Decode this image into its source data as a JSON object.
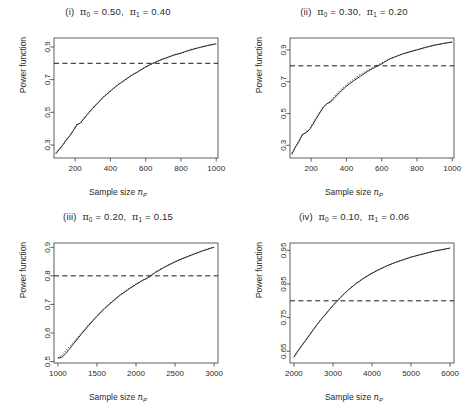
{
  "figure": {
    "background": "#ffffff",
    "line_color": "#2a2a2a",
    "reference_line_color": "#1a1a1a",
    "axis_color": "#4d4d4d",
    "n_panels": 4
  },
  "common": {
    "ylabel": "Power function",
    "xlabel_prefix": "Sample size ",
    "xlabel_symbol": "n",
    "xlabel_subscript": "P"
  },
  "chart_data": [
    {
      "type": "line",
      "panel_id": "i",
      "title": "(i)  π₀ = 0.50,  π₁ = 0.40",
      "title_parts": {
        "index": "(i)",
        "pi0_label": "π",
        "pi0_sub": "0",
        "pi0_value": "0.50",
        "pi1_label": "π",
        "pi1_sub": "1",
        "pi1_value": "0.40"
      },
      "xlabel": "Sample size n_P",
      "ylabel": "Power function",
      "xlim": [
        80,
        1010
      ],
      "ylim": [
        0.22,
        0.955
      ],
      "xticks": [
        200,
        400,
        600,
        800,
        1000
      ],
      "xticklabels": [
        "200",
        "400",
        "600",
        "800",
        "1000"
      ],
      "yticks": [
        0.3,
        0.5,
        0.7,
        0.9
      ],
      "yticklabels": [
        "0.3",
        "0.5",
        "0.7",
        "0.9"
      ],
      "grid": false,
      "legend": null,
      "reference_line": {
        "orientation": "horizontal",
        "y": 0.8,
        "style": "dashed"
      },
      "series": [
        {
          "name": "exact power",
          "style": "solid",
          "x": [
            90,
            110,
            130,
            150,
            170,
            190,
            210,
            230,
            250,
            270,
            300,
            330,
            360,
            400,
            440,
            480,
            520,
            560,
            600,
            640,
            680,
            720,
            760,
            800,
            850,
            900,
            950,
            1000
          ],
          "y": [
            0.245,
            0.272,
            0.3,
            0.33,
            0.358,
            0.388,
            0.422,
            0.436,
            0.46,
            0.489,
            0.524,
            0.56,
            0.592,
            0.631,
            0.665,
            0.697,
            0.725,
            0.752,
            0.777,
            0.8,
            0.818,
            0.835,
            0.85,
            0.863,
            0.88,
            0.896,
            0.908,
            0.92
          ]
        },
        {
          "name": "approximate power",
          "style": "dotted",
          "x": [
            90,
            110,
            130,
            150,
            170,
            190,
            210,
            230,
            250,
            270,
            300,
            330,
            360,
            400,
            440,
            480,
            520,
            560,
            600,
            640,
            680,
            720,
            760,
            800,
            850,
            900,
            950,
            1000
          ],
          "y": [
            0.252,
            0.28,
            0.296,
            0.336,
            0.352,
            0.394,
            0.43,
            0.43,
            0.468,
            0.484,
            0.53,
            0.556,
            0.597,
            0.627,
            0.67,
            0.693,
            0.73,
            0.748,
            0.781,
            0.797,
            0.822,
            0.832,
            0.854,
            0.86,
            0.884,
            0.893,
            0.911,
            0.918
          ]
        }
      ]
    },
    {
      "type": "line",
      "panel_id": "ii",
      "title": "(ii)  π₀ = 0.30,  π₁ = 0.20",
      "title_parts": {
        "index": "(ii)",
        "pi0_label": "π",
        "pi0_sub": "0",
        "pi0_value": "0.30",
        "pi1_label": "π",
        "pi1_sub": "1",
        "pi1_value": "0.20"
      },
      "xlabel": "Sample size n_P",
      "ylabel": "Power function",
      "xlim": [
        80,
        1010
      ],
      "ylim": [
        0.22,
        0.975
      ],
      "xticks": [
        200,
        400,
        600,
        800,
        1000
      ],
      "xticklabels": [
        "200",
        "400",
        "600",
        "800",
        "1000"
      ],
      "yticks": [
        0.3,
        0.5,
        0.7,
        0.9
      ],
      "yticklabels": [
        "0.3",
        "0.5",
        "0.7",
        "0.9"
      ],
      "grid": false,
      "legend": null,
      "reference_line": {
        "orientation": "horizontal",
        "y": 0.8,
        "style": "dashed"
      },
      "series": [
        {
          "name": "exact power",
          "style": "solid",
          "x": [
            90,
            110,
            130,
            150,
            170,
            190,
            210,
            230,
            250,
            270,
            290,
            310,
            330,
            360,
            400,
            440,
            480,
            520,
            560,
            600,
            640,
            680,
            720,
            760,
            800,
            850,
            900,
            950,
            1000
          ],
          "y": [
            0.242,
            0.288,
            0.322,
            0.368,
            0.378,
            0.398,
            0.432,
            0.47,
            0.505,
            0.54,
            0.562,
            0.572,
            0.596,
            0.63,
            0.672,
            0.705,
            0.735,
            0.765,
            0.79,
            0.812,
            0.84,
            0.858,
            0.875,
            0.888,
            0.9,
            0.916,
            0.93,
            0.94,
            0.95
          ]
        },
        {
          "name": "approximate power",
          "style": "dotted",
          "x": [
            90,
            110,
            130,
            150,
            170,
            190,
            210,
            230,
            250,
            270,
            290,
            310,
            330,
            360,
            400,
            440,
            480,
            520,
            560,
            600,
            640,
            680,
            720,
            760,
            800,
            850,
            900,
            950,
            1000
          ],
          "y": [
            0.25,
            0.286,
            0.33,
            0.362,
            0.386,
            0.4,
            0.44,
            0.476,
            0.512,
            0.545,
            0.56,
            0.582,
            0.606,
            0.642,
            0.682,
            0.716,
            0.746,
            0.772,
            0.796,
            0.818,
            0.842,
            0.86,
            0.876,
            0.89,
            0.902,
            0.918,
            0.93,
            0.942,
            0.95
          ]
        }
      ]
    },
    {
      "type": "line",
      "panel_id": "iii",
      "title": "(iii)  π₀ = 0.20,  π₁ = 0.15",
      "title_parts": {
        "index": "(iii)",
        "pi0_label": "π",
        "pi0_sub": "0",
        "pi0_value": "0.20",
        "pi1_label": "π",
        "pi1_sub": "1",
        "pi1_value": "0.15"
      },
      "xlabel": "Sample size n_P",
      "ylabel": "Power function",
      "xlim": [
        950,
        3050
      ],
      "ylim": [
        0.495,
        0.915
      ],
      "xticks": [
        1000,
        1500,
        2000,
        2500,
        3000
      ],
      "xticklabels": [
        "1000",
        "1500",
        "2000",
        "2500",
        "3000"
      ],
      "yticks": [
        0.5,
        0.6,
        0.7,
        0.8,
        0.9
      ],
      "yticklabels": [
        "0.5",
        "0.6",
        "0.7",
        "0.8",
        "0.9"
      ],
      "grid": false,
      "legend": null,
      "reference_line": {
        "orientation": "horizontal",
        "y": 0.8,
        "style": "dashed"
      },
      "series": [
        {
          "name": "exact power",
          "style": "solid",
          "x": [
            1000,
            1050,
            1100,
            1150,
            1200,
            1300,
            1400,
            1500,
            1600,
            1700,
            1800,
            1900,
            2000,
            2100,
            2150,
            2250,
            2350,
            2450,
            2550,
            2650,
            2750,
            2850,
            2950,
            3000
          ],
          "y": [
            0.512,
            0.515,
            0.528,
            0.545,
            0.562,
            0.596,
            0.628,
            0.658,
            0.686,
            0.71,
            0.733,
            0.752,
            0.77,
            0.786,
            0.792,
            0.812,
            0.828,
            0.842,
            0.855,
            0.866,
            0.877,
            0.887,
            0.896,
            0.9
          ]
        },
        {
          "name": "approximate power",
          "style": "dotted",
          "x": [
            1000,
            1050,
            1100,
            1150,
            1200,
            1300,
            1400,
            1500,
            1600,
            1700,
            1800,
            1900,
            2000,
            2100,
            2150,
            2250,
            2350,
            2450,
            2550,
            2650,
            2750,
            2850,
            2950,
            3000
          ],
          "y": [
            0.513,
            0.522,
            0.538,
            0.553,
            0.568,
            0.6,
            0.632,
            0.661,
            0.688,
            0.713,
            0.735,
            0.754,
            0.772,
            0.788,
            0.795,
            0.814,
            0.83,
            0.844,
            0.856,
            0.868,
            0.878,
            0.888,
            0.897,
            0.901
          ]
        }
      ]
    },
    {
      "type": "line",
      "panel_id": "iv",
      "title": "(iv)  π₀ = 0.10,  π₁ = 0.06",
      "title_parts": {
        "index": "(iv)",
        "pi0_label": "π",
        "pi0_sub": "0",
        "pi0_value": "0.10",
        "pi1_label": "π",
        "pi1_sub": "1",
        "pi1_value": "0.06"
      },
      "xlabel": "Sample size n_P",
      "ylabel": "Power function",
      "xlim": [
        1900,
        6100
      ],
      "ylim": [
        0.615,
        0.972
      ],
      "xticks": [
        2000,
        3000,
        4000,
        5000,
        6000
      ],
      "xticklabels": [
        "2000",
        "3000",
        "4000",
        "5000",
        "6000"
      ],
      "yticks": [
        0.65,
        0.75,
        0.85,
        0.95
      ],
      "yticklabels": [
        "0.65",
        "0.75",
        "0.85",
        "0.95"
      ],
      "grid": false,
      "legend": null,
      "reference_line": {
        "orientation": "horizontal",
        "y": 0.8,
        "style": "dashed"
      },
      "series": [
        {
          "name": "exact power",
          "style": "solid",
          "x": [
            2000,
            2100,
            2200,
            2300,
            2400,
            2500,
            2600,
            2700,
            2800,
            2900,
            3000,
            3100,
            3200,
            3300,
            3400,
            3600,
            3800,
            4000,
            4200,
            4400,
            4600,
            4800,
            5000,
            5200,
            5400,
            5600,
            5800,
            6000
          ],
          "y": [
            0.632,
            0.65,
            0.666,
            0.682,
            0.698,
            0.714,
            0.73,
            0.745,
            0.758,
            0.772,
            0.786,
            0.798,
            0.81,
            0.822,
            0.833,
            0.852,
            0.868,
            0.882,
            0.894,
            0.905,
            0.914,
            0.922,
            0.93,
            0.936,
            0.942,
            0.948,
            0.952,
            0.957
          ]
        },
        {
          "name": "approximate power",
          "style": "dotted",
          "x": [
            2000,
            2100,
            2200,
            2300,
            2400,
            2500,
            2600,
            2700,
            2800,
            2900,
            3000,
            3100,
            3200,
            3300,
            3400,
            3600,
            3800,
            4000,
            4200,
            4400,
            4600,
            4800,
            5000,
            5200,
            5400,
            5600,
            5800,
            6000
          ],
          "y": [
            0.634,
            0.652,
            0.668,
            0.684,
            0.7,
            0.716,
            0.731,
            0.746,
            0.76,
            0.774,
            0.787,
            0.8,
            0.812,
            0.823,
            0.834,
            0.853,
            0.869,
            0.883,
            0.895,
            0.905,
            0.915,
            0.923,
            0.93,
            0.937,
            0.943,
            0.948,
            0.953,
            0.957
          ]
        }
      ]
    }
  ]
}
